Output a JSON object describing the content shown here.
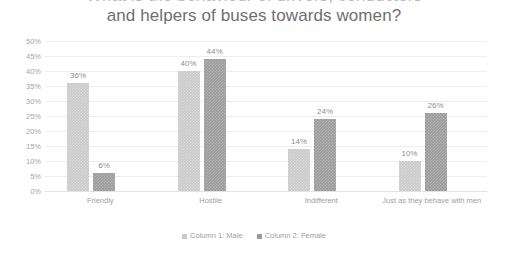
{
  "chart_data": {
    "type": "bar",
    "title": "and helpers of buses towards women?",
    "title_clipped_line": "What is the behaviour of drivers, conductors",
    "xlabel": "",
    "ylabel": "",
    "ylim": [
      0,
      50
    ],
    "ytick_labels": [
      "50%",
      "45%",
      "40%",
      "35%",
      "30%",
      "25%",
      "20%",
      "15%",
      "10%",
      "5%",
      "0%"
    ],
    "ytick_values": [
      50,
      45,
      40,
      35,
      30,
      25,
      20,
      15,
      10,
      5,
      0
    ],
    "grid": true,
    "legend_position": "bottom",
    "categories": [
      "Friendly",
      "Hostile",
      "Indifferent",
      "Just as they behave with men"
    ],
    "series": [
      {
        "name": "Column 1: Male",
        "color": "#c9c9c9",
        "values": [
          36,
          40,
          14,
          10
        ],
        "value_labels": [
          "36%",
          "40%",
          "14%",
          "10%"
        ]
      },
      {
        "name": "Column 2: Female",
        "color": "#9b9b9b",
        "values": [
          6,
          44,
          24,
          26
        ],
        "value_labels": [
          "6%",
          "44%",
          "24%",
          "26%"
        ]
      }
    ]
  },
  "legend": {
    "items": [
      {
        "label": "Column 1: Male",
        "color": "#c9c9c9"
      },
      {
        "label": "Column 2: Female",
        "color": "#9b9b9b"
      }
    ]
  }
}
